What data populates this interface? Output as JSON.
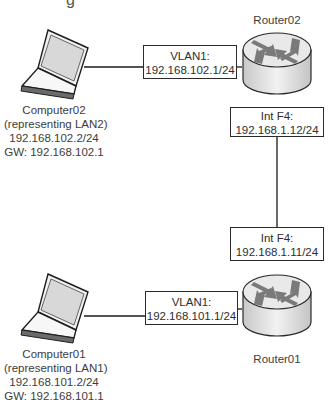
{
  "diagram": {
    "title_fragment": "g",
    "nodes": {
      "router02": {
        "name": "Router02"
      },
      "router01": {
        "name": "Router01"
      },
      "computer02": {
        "name": "Computer02",
        "role": "(representing LAN2)",
        "ip": "192.168.102.2/24",
        "gateway": "GW:  192.168.102.1"
      },
      "computer01": {
        "name": "Computer01",
        "role": "(representing LAN1)",
        "ip": "192.168.101.2/24",
        "gateway": "GW:  192.168.101.1"
      }
    },
    "interfaces": {
      "r02_vlan1": {
        "name": "VLAN1:",
        "ip": "192.168.102.1/24"
      },
      "r02_f4": {
        "name": "Int F4:",
        "ip": "192.168.1.12/24"
      },
      "r01_f4": {
        "name": "Int F4:",
        "ip": "192.168.1.11/24"
      },
      "r01_vlan1": {
        "name": "VLAN1:",
        "ip": "192.168.101.1/24"
      }
    },
    "links": [
      {
        "from": "computer02",
        "to": "router02"
      },
      {
        "from": "router02",
        "to": "router01"
      },
      {
        "from": "computer01",
        "to": "router01"
      }
    ],
    "colors": {
      "line": "#1a1a1a",
      "router_body": "#d9d9d9",
      "router_top": "#eeeeee",
      "arrow": "#7a7a7a"
    }
  }
}
